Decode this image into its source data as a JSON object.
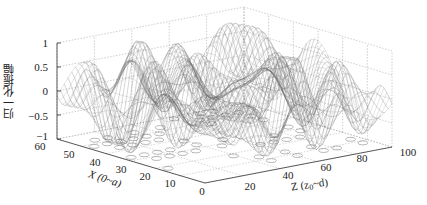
{
  "chart_data": {
    "type": "surface",
    "title": "",
    "xlabel": "X (0~a)",
    "zlabel_axis": "Z (z0~d)",
    "ylabel": "归一化振幅",
    "x_axis": {
      "label": "X (0~a)",
      "range": [
        0,
        60
      ],
      "ticks": [
        0,
        10,
        20,
        30,
        40,
        50,
        60
      ]
    },
    "z_axis": {
      "label": "Z (z₀~d)",
      "range": [
        0,
        100
      ],
      "ticks": [
        0,
        20,
        40,
        60,
        80,
        100
      ]
    },
    "amplitude_axis": {
      "label": "归一化振幅",
      "range": [
        -1,
        1
      ],
      "ticks": [
        -1,
        -0.5,
        0,
        0.5,
        1
      ]
    },
    "grid": true,
    "render": "mesh wireframe with contour projection on floor",
    "colors": {
      "mesh": "#6b6b6b",
      "grid": "#9a9a9a",
      "axis": "#333333"
    }
  },
  "labels": {
    "ylabel": "归一化振幅",
    "x_title": "X (0~a)",
    "z_title_prefix": "Z (z",
    "z_title_sub": "0",
    "z_title_suffix": "~d)"
  },
  "ticks": {
    "amp": [
      "1",
      "0.5",
      "0",
      "−0.5",
      "−1"
    ],
    "x": [
      "60",
      "50",
      "40",
      "30",
      "20",
      "10",
      "0"
    ],
    "z": [
      "20",
      "40",
      "60",
      "80",
      "100"
    ]
  }
}
